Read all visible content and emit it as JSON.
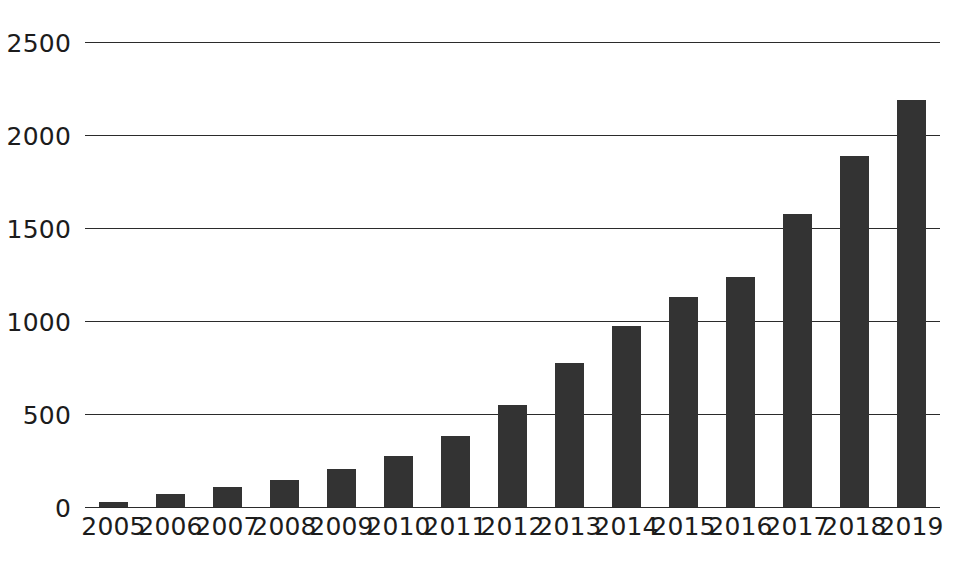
{
  "chart_data": {
    "type": "bar",
    "title": "",
    "subtitle": "",
    "xlabel": "",
    "ylabel": "",
    "categories": [
      "2005",
      "2006",
      "2007",
      "2008",
      "2009",
      "2010",
      "2011",
      "2012",
      "2013",
      "2014",
      "2015",
      "2016",
      "2017",
      "2018",
      "2019"
    ],
    "values": [
      27,
      70,
      105,
      145,
      207,
      272,
      382,
      548,
      775,
      973,
      1128,
      1237,
      1575,
      1887,
      2190
    ],
    "series": [
      {
        "name": "",
        "values": [
          27,
          70,
          105,
          145,
          207,
          272,
          382,
          548,
          775,
          973,
          1128,
          1237,
          1575,
          1887,
          2190
        ]
      }
    ],
    "ylim": [
      0,
      2500
    ],
    "yticks": [
      0,
      500,
      1000,
      1500,
      2000,
      2500
    ],
    "ytick_labels": [
      "0",
      "500",
      "1000",
      "1500",
      "2000",
      "2500"
    ],
    "grid": true,
    "grid_axis": "y",
    "legend": false,
    "legend_position": "none",
    "annotations": [],
    "bar_color": "#333333",
    "grid_color": "#2b2b2b",
    "background_color": "#ffffff",
    "text_color": "#1c1c1c"
  }
}
